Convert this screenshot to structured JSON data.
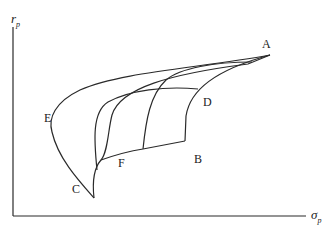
{
  "diagram": {
    "axes": {
      "y_label": "r",
      "y_label_sub": "p",
      "x_label": "σ",
      "x_label_sub": "p"
    },
    "points": {
      "A": "A",
      "B": "B",
      "C": "C",
      "D": "D",
      "E": "E",
      "F": "F"
    },
    "colors": {
      "line": "#2a2a2a",
      "background": "#ffffff"
    }
  }
}
